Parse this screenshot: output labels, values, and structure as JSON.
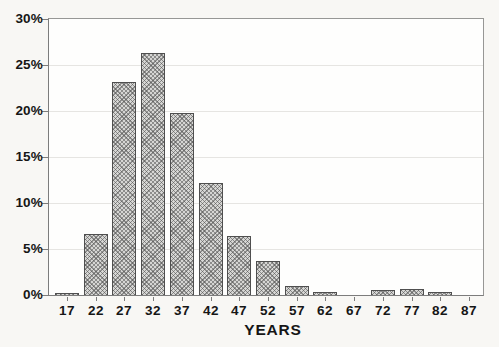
{
  "chart_data": {
    "type": "bar",
    "title": "",
    "xlabel": "YEARS",
    "ylabel": "",
    "unit": "%",
    "categories": [
      "17",
      "22",
      "27",
      "32",
      "37",
      "42",
      "47",
      "52",
      "57",
      "62",
      "67",
      "72",
      "77",
      "82",
      "87"
    ],
    "values": [
      0.2,
      6.6,
      23.1,
      26.3,
      19.8,
      12.2,
      6.4,
      3.7,
      1.0,
      0.3,
      0,
      0.5,
      0.6,
      0.3,
      0
    ],
    "y_ticks": [
      "0%",
      "5%",
      "10%",
      "15%",
      "20%",
      "25%",
      "30%"
    ],
    "y_tick_step": 5,
    "ylim": [
      0,
      30
    ],
    "grid": "horizontal-light",
    "legend": "none",
    "bar_style": "diagonal-crosshatch-hatch",
    "colors": {
      "page_bg": "#f8f7f4",
      "plot_bg": "#fefefd",
      "gridline": "#e6e5e2",
      "axis": "#7c7c7c",
      "axis_light": "#979795",
      "bar_fill": "#d6d6d4",
      "bar_hatch": "rgba(80,80,80,0.55)",
      "bar_border": "#4f4f4f",
      "text": "#161616"
    }
  }
}
